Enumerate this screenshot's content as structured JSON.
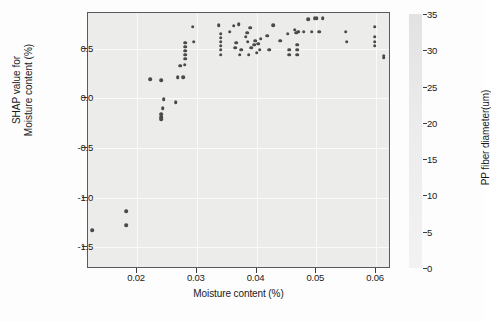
{
  "chart_data": {
    "type": "scatter",
    "title": "",
    "xlabel": "Moisture content (%)",
    "ylabel": "SHAP value for\nMoisture content (%)",
    "ylabel_line1": "SHAP value for",
    "ylabel_line2": "Moisture content (%)",
    "xlim": [
      0.0118,
      0.0625
    ],
    "ylim": [
      -1.72,
      0.86
    ],
    "xticks": [
      0.02,
      0.03,
      0.04,
      0.05,
      0.06
    ],
    "xtick_labels": [
      "0.02",
      "0.03",
      "0.04",
      "0.05",
      "0.06"
    ],
    "yticks": [
      0.5,
      0.0,
      -0.5,
      -1.0,
      -1.5
    ],
    "ytick_labels": [
      "0.5",
      "0.0",
      "-0.5",
      "-1.0",
      "-1.5"
    ],
    "grid": true,
    "grid_color": "#fafafa",
    "panel_color": "#ececeb",
    "marker_color": "#4a4a4a",
    "colorbar": {
      "label": "PP fiber diameter(um)",
      "ticks": [
        35,
        30,
        25,
        20,
        15,
        10,
        5,
        0
      ],
      "tick_labels": [
        "35",
        "30",
        "25",
        "20",
        "15",
        "10",
        "5",
        "0"
      ],
      "vmin": 0,
      "vmax": 35,
      "orientation": "vertical",
      "position": "right",
      "gradient_top": "#e2e2e2",
      "gradient_bottom": "#f2f2f2"
    },
    "points": [
      {
        "x": 0.0125,
        "y": -1.33
      },
      {
        "x": 0.0182,
        "y": -1.14
      },
      {
        "x": 0.0182,
        "y": -1.28
      },
      {
        "x": 0.0222,
        "y": 0.19
      },
      {
        "x": 0.024,
        "y": 0.18
      },
      {
        "x": 0.024,
        "y": -0.16
      },
      {
        "x": 0.024,
        "y": -0.19
      },
      {
        "x": 0.024,
        "y": -0.21
      },
      {
        "x": 0.0243,
        "y": -0.1
      },
      {
        "x": 0.0245,
        "y": -0.01
      },
      {
        "x": 0.0265,
        "y": -0.04
      },
      {
        "x": 0.0268,
        "y": 0.21
      },
      {
        "x": 0.0272,
        "y": 0.33
      },
      {
        "x": 0.0277,
        "y": 0.21
      },
      {
        "x": 0.028,
        "y": 0.34
      },
      {
        "x": 0.0281,
        "y": 0.4
      },
      {
        "x": 0.0281,
        "y": 0.44
      },
      {
        "x": 0.0281,
        "y": 0.48
      },
      {
        "x": 0.0281,
        "y": 0.52
      },
      {
        "x": 0.0281,
        "y": 0.56
      },
      {
        "x": 0.0293,
        "y": 0.72
      },
      {
        "x": 0.0295,
        "y": 0.57
      },
      {
        "x": 0.0337,
        "y": 0.74
      },
      {
        "x": 0.034,
        "y": 0.44
      },
      {
        "x": 0.034,
        "y": 0.49
      },
      {
        "x": 0.034,
        "y": 0.53
      },
      {
        "x": 0.034,
        "y": 0.57
      },
      {
        "x": 0.034,
        "y": 0.61
      },
      {
        "x": 0.034,
        "y": 0.65
      },
      {
        "x": 0.0355,
        "y": 0.67
      },
      {
        "x": 0.0362,
        "y": 0.73
      },
      {
        "x": 0.0364,
        "y": 0.51
      },
      {
        "x": 0.0366,
        "y": 0.56
      },
      {
        "x": 0.037,
        "y": 0.75
      },
      {
        "x": 0.0372,
        "y": 0.44
      },
      {
        "x": 0.0374,
        "y": 0.49
      },
      {
        "x": 0.0382,
        "y": 0.62
      },
      {
        "x": 0.0384,
        "y": 0.66
      },
      {
        "x": 0.0385,
        "y": 0.57
      },
      {
        "x": 0.0387,
        "y": 0.44
      },
      {
        "x": 0.0389,
        "y": 0.71
      },
      {
        "x": 0.0391,
        "y": 0.51
      },
      {
        "x": 0.0396,
        "y": 0.54
      },
      {
        "x": 0.0398,
        "y": 0.58
      },
      {
        "x": 0.04,
        "y": 0.46
      },
      {
        "x": 0.0403,
        "y": 0.55
      },
      {
        "x": 0.0405,
        "y": 0.49
      },
      {
        "x": 0.0407,
        "y": 0.6
      },
      {
        "x": 0.0418,
        "y": 0.63
      },
      {
        "x": 0.0421,
        "y": 0.49
      },
      {
        "x": 0.0428,
        "y": 0.74
      },
      {
        "x": 0.044,
        "y": 0.58
      },
      {
        "x": 0.0452,
        "y": 0.65
      },
      {
        "x": 0.0455,
        "y": 0.44
      },
      {
        "x": 0.0455,
        "y": 0.49
      },
      {
        "x": 0.0464,
        "y": 0.69
      },
      {
        "x": 0.0466,
        "y": 0.66
      },
      {
        "x": 0.0468,
        "y": 0.44
      },
      {
        "x": 0.0468,
        "y": 0.49
      },
      {
        "x": 0.0468,
        "y": 0.54
      },
      {
        "x": 0.047,
        "y": 0.67
      },
      {
        "x": 0.0479,
        "y": 0.67
      },
      {
        "x": 0.0486,
        "y": 0.8
      },
      {
        "x": 0.0492,
        "y": 0.67
      },
      {
        "x": 0.0497,
        "y": 0.81
      },
      {
        "x": 0.0501,
        "y": 0.81
      },
      {
        "x": 0.0505,
        "y": 0.67
      },
      {
        "x": 0.0511,
        "y": 0.81
      },
      {
        "x": 0.0549,
        "y": 0.67
      },
      {
        "x": 0.0551,
        "y": 0.57
      },
      {
        "x": 0.0598,
        "y": 0.72
      },
      {
        "x": 0.0598,
        "y": 0.62
      },
      {
        "x": 0.0598,
        "y": 0.57
      },
      {
        "x": 0.0598,
        "y": 0.53
      },
      {
        "x": 0.0613,
        "y": 0.43
      },
      {
        "x": 0.0613,
        "y": 0.41
      }
    ]
  }
}
